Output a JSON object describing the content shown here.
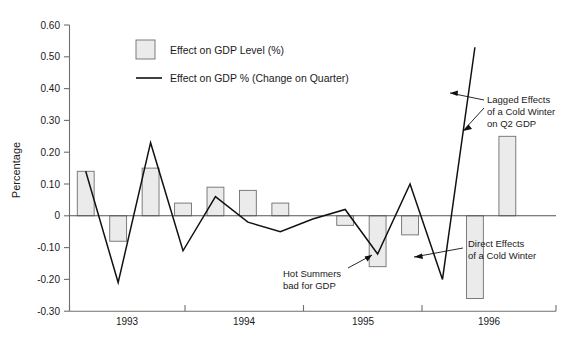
{
  "chart_data": {
    "type": "bar",
    "title": "",
    "xlabel": "",
    "ylabel": "Percentage",
    "ylim": [
      -0.3,
      0.6
    ],
    "ytick_labels": [
      "0.60",
      "0.50",
      "0.40",
      "0.30",
      "0.20",
      "0.10",
      "0",
      "-0.10",
      "-0.20",
      "-0.30"
    ],
    "ytick_values": [
      0.6,
      0.5,
      0.4,
      0.3,
      0.2,
      0.1,
      0,
      -0.1,
      -0.2,
      -0.3
    ],
    "xtick_labels": [
      "1993",
      "1994",
      "1995",
      "1996"
    ],
    "grid": false,
    "legend_position": "top-center",
    "legend": [
      {
        "name": "Effect on GDP Level (%)",
        "marker": "bar-swatch"
      },
      {
        "name": "Effect on GDP % (Change on Quarter)",
        "marker": "line"
      }
    ],
    "x_quarters": [
      "1992Q4",
      "1993Q1",
      "1993Q2",
      "1993Q3",
      "1993Q4",
      "1994Q1",
      "1994Q2",
      "1994Q3",
      "1994Q4",
      "1995Q1",
      "1995Q2",
      "1995Q3",
      "1995Q4",
      "1996Q1",
      "1996Q2"
    ],
    "series": [
      {
        "name": "Effect on GDP Level (%)",
        "type": "bar",
        "values": [
          0.14,
          -0.08,
          0.15,
          0.04,
          0.09,
          0.08,
          0.04,
          0.0,
          -0.03,
          -0.16,
          -0.06,
          0.0,
          -0.26,
          0.25,
          0.0
        ]
      },
      {
        "name": "Effect on GDP % (Change on Quarter)",
        "type": "line",
        "values": [
          0.14,
          -0.21,
          0.23,
          -0.11,
          0.06,
          -0.02,
          -0.05,
          -0.01,
          0.02,
          -0.12,
          0.1,
          -0.2,
          0.53
        ]
      }
    ],
    "annotations": [
      {
        "text_lines": [
          "Hot Summers",
          "bad for GDP"
        ],
        "target": "1995Q1 bar"
      },
      {
        "text_lines": [
          "Direct Effects",
          "of a Cold Winter"
        ],
        "target": "1995Q4 bar"
      },
      {
        "text_lines": [
          "Lagged Effects",
          "of a Cold Winter",
          "on Q2 GDP"
        ],
        "target": "1996Q1 bar and line"
      }
    ]
  },
  "colors": {
    "bar_fill": "#ebebeb",
    "bar_stroke": "#6f6f6f",
    "line": "#111111",
    "axis": "#6f6f6f",
    "text": "#1a1a1a",
    "background": "#ffffff"
  }
}
